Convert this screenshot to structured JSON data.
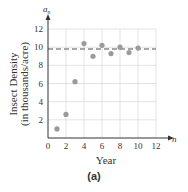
{
  "chart_data": {
    "type": "scatter",
    "title": "",
    "xlabel": "Year",
    "ylabel": "Insect Density",
    "ylabel_sub": "(in thousands/acre)",
    "x_axis_var": "n",
    "y_axis_var": "a",
    "y_axis_var_sub": "n",
    "xlim": [
      0,
      12
    ],
    "ylim": [
      0,
      12
    ],
    "x_ticks": [
      0,
      2,
      4,
      6,
      8,
      10,
      12
    ],
    "y_ticks": [
      2,
      4,
      6,
      8,
      10,
      12
    ],
    "grid": true,
    "legend": null,
    "series": [
      {
        "name": "a_n",
        "x": [
          1,
          2,
          3,
          4,
          5,
          6,
          7,
          8,
          9,
          10
        ],
        "values": [
          1.0,
          2.6,
          6.2,
          10.4,
          9.0,
          10.2,
          9.3,
          10.0,
          9.4,
          9.9
        ],
        "color": "#9a9a9a"
      }
    ],
    "reference_lines": [
      {
        "type": "horizontal",
        "y": 9.8,
        "style": "dashed",
        "color": "#8a8a8a"
      }
    ]
  },
  "caption": "(a)"
}
